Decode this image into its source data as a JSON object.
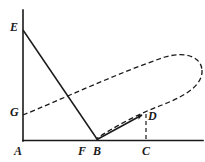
{
  "figure": {
    "background_color": "#ffffff",
    "stroke_color": "#1a1a1a",
    "label_color": "#1a1a1a",
    "width": 205,
    "height": 162
  },
  "axes": {
    "vertical": {
      "name": "vertical-axis",
      "x1": 23,
      "y1": 10,
      "x2": 23,
      "y2": 141
    },
    "horizontal": {
      "name": "horizontal-axis",
      "x1": 23,
      "y1": 140.5,
      "x2": 203,
      "y2": 140.5
    }
  },
  "points": [
    {
      "id": "A",
      "label": "A",
      "x": 23,
      "y": 140.5,
      "label_x": 14,
      "label_y": 145
    },
    {
      "id": "B",
      "label": "B",
      "x": 98,
      "y": 140.5,
      "label_x": 93,
      "label_y": 145
    },
    {
      "id": "C",
      "label": "C",
      "x": 146,
      "y": 140.5,
      "label_x": 142,
      "label_y": 145
    },
    {
      "id": "D",
      "label": "D",
      "x": 146,
      "y": 115,
      "label_x": 148,
      "label_y": 110
    },
    {
      "id": "E",
      "label": "E",
      "x": 23,
      "y": 30,
      "label_x": 10,
      "label_y": 21
    },
    {
      "id": "F",
      "label": "F",
      "x": 84,
      "y": 140.5,
      "label_x": 78,
      "label_y": 145
    },
    {
      "id": "G",
      "label": "G",
      "x": 23,
      "y": 115,
      "label_x": 10,
      "label_y": 106
    }
  ],
  "segments": [
    {
      "name": "segment-EB",
      "style": "solid",
      "from": "E",
      "to": "B",
      "x1": 23,
      "y1": 30,
      "x2": 98,
      "y2": 140.5
    },
    {
      "name": "segment-BD-arrow",
      "style": "solid-arrow",
      "from": "B",
      "to": "D",
      "x1": 97,
      "y1": 139.5,
      "x2": 143.5,
      "y2": 113.5
    },
    {
      "name": "segment-DC-dashed",
      "style": "dashed",
      "from": "D",
      "to": "C",
      "x1": 146,
      "y1": 114,
      "x2": 146,
      "y2": 140
    }
  ],
  "curves": [
    {
      "name": "dashed-oval-upper-branch",
      "style": "dashed",
      "description": "dashed arc from G rising to the right tip of the oval",
      "path": "M 23 115 C 60 100 120 72 165 57 C 186 51 201 57 202 70"
    },
    {
      "name": "dashed-oval-lower-branch",
      "style": "dashed",
      "description": "dashed arc returning from the right tip through D down to B",
      "path": "M 202 70 C 203 84 188 95 162 105 C 140 113 112 128 96 139"
    }
  ],
  "dash_pattern": "5,3",
  "stroke_width": 1.3
}
